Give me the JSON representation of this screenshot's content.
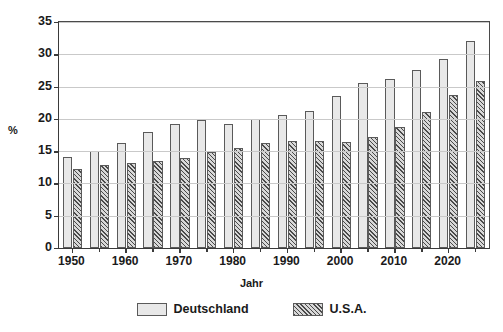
{
  "chart_data": {
    "type": "bar",
    "title": "",
    "subtitle": "",
    "xlabel": "Jahr",
    "ylabel": "%",
    "ylim": [
      0,
      35
    ],
    "ytick_values": [
      0,
      5,
      10,
      15,
      20,
      25,
      30,
      35
    ],
    "ytick_labels": [
      "0",
      "5",
      "10",
      "15",
      "20",
      "25",
      "30",
      "35"
    ],
    "xtick_labels": [
      "1950",
      "1960",
      "1970",
      "1980",
      "1990",
      "2000",
      "2010",
      "2020"
    ],
    "xtick_values": [
      1950,
      1960,
      1970,
      1980,
      1990,
      2000,
      2010,
      2020
    ],
    "xlim": [
      1947.5,
      1872.5
    ],
    "grid": "horizontal",
    "legend_position": "bottom-center",
    "categories": [
      "1950",
      "1955",
      "1960",
      "1965",
      "1970",
      "1975",
      "1980",
      "1985",
      "1990",
      "1995",
      "2000",
      "2005",
      "2010",
      "2015",
      "2020"
    ],
    "series": [
      {
        "name": "Deutschland",
        "color": "#e8e8e8",
        "pattern": "fine-cross-hatch",
        "values": [
          14.1,
          15.0,
          16.3,
          17.9,
          19.2,
          19.9,
          19.2,
          20.0,
          20.6,
          21.2,
          23.5,
          25.5,
          26.2,
          27.5,
          29.2
        ]
      },
      {
        "name": "U.S.A.",
        "color": "#d8d8d8",
        "pattern": "diagonal-hatch",
        "values": [
          12.2,
          12.9,
          13.1,
          13.4,
          13.9,
          14.8,
          15.5,
          16.3,
          16.6,
          16.5,
          16.4,
          17.2,
          18.8,
          21.1,
          23.7
        ]
      }
    ],
    "extra_bars": [
      {
        "series": "Deutschland",
        "category": "2025",
        "value": 32.0
      },
      {
        "series": "U.S.A.",
        "category": "2025",
        "value": 25.8
      }
    ]
  },
  "legend": {
    "entries": [
      {
        "label": "Deutschland",
        "swatch": "light-cross-hatch-swatch"
      },
      {
        "label": "U.S.A.",
        "swatch": "dark-diagonal-hatch-swatch"
      }
    ]
  },
  "axes": {
    "y_axis_title": "%",
    "x_axis_title": "Jahr"
  }
}
